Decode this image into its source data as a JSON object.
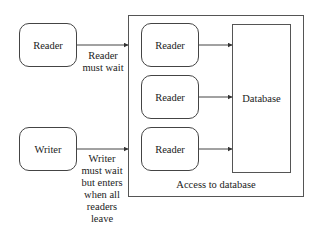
{
  "diagram": {
    "container": {
      "label": "Access to database"
    },
    "external": {
      "reader": {
        "label": "Reader",
        "note": [
          "Reader",
          "must wait"
        ]
      },
      "writer": {
        "label": "Writer",
        "note": [
          "Writer",
          "must wait",
          "but enters",
          "when all",
          "readers",
          "leave"
        ]
      }
    },
    "inside_readers": [
      {
        "label": "Reader"
      },
      {
        "label": "Reader"
      },
      {
        "label": "Reader"
      }
    ],
    "database": {
      "label": "Database"
    },
    "edges": [
      {
        "from": "external.reader",
        "to": "container",
        "style": "arrow"
      },
      {
        "from": "external.writer",
        "to": "container",
        "style": "arrow"
      },
      {
        "from": "inside_readers.0",
        "to": "database",
        "style": "arrow"
      },
      {
        "from": "inside_readers.1",
        "to": "database",
        "style": "arrow"
      },
      {
        "from": "inside_readers.2",
        "to": "database",
        "style": "arrow"
      }
    ],
    "colors": {
      "stroke": "#444444",
      "background": "#ffffff",
      "text": "#222222"
    }
  }
}
